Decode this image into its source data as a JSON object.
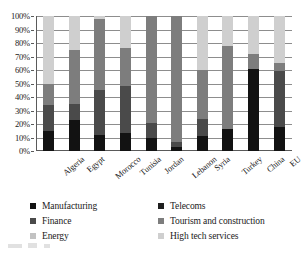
{
  "chart_data": {
    "type": "bar",
    "subtype": "stacked-100-percent",
    "title": "",
    "xlabel": "",
    "ylabel": "",
    "ylim": [
      0,
      100
    ],
    "yticks": [
      "0%",
      "10%",
      "20%",
      "30%",
      "40%",
      "50%",
      "60%",
      "70%",
      "80%",
      "90%",
      "100%"
    ],
    "grid": true,
    "legend_position": "bottom",
    "categories": [
      "Algeria",
      "Egypt",
      "Morocco",
      "Tunisia",
      "Jordan",
      "Lebanon",
      "Syria",
      "Turkey",
      "China",
      "EU"
    ],
    "series": [
      {
        "name": "Manufacturing",
        "color": "#121212",
        "values": [
          15,
          23,
          12,
          13,
          10,
          3,
          11,
          16,
          61,
          18
        ]
      },
      {
        "name": "Finance",
        "color": "#4a4a4a",
        "values": [
          19,
          12,
          33,
          35,
          11,
          4,
          13,
          0,
          0,
          41
        ]
      },
      {
        "name": "Energy",
        "color": "#c2c2c2",
        "values": [
          0,
          0,
          0,
          0,
          0,
          0,
          0,
          0,
          0,
          0
        ]
      },
      {
        "name": "Telecoms",
        "color": "#1f1f1f",
        "values": [
          0,
          0,
          0,
          0,
          0,
          0,
          0,
          0,
          0,
          0
        ]
      },
      {
        "name": "Tourism and construction",
        "color": "#7d7d7d",
        "values": [
          16,
          40,
          53,
          28,
          79,
          93,
          36,
          62,
          11,
          6
        ]
      },
      {
        "name": "High tech services",
        "color": "#cfcfcf",
        "values": [
          50,
          25,
          2,
          24,
          0,
          0,
          40,
          22,
          28,
          35
        ]
      }
    ],
    "stack_order": [
      "Manufacturing",
      "Finance",
      "Tourism and construction",
      "High tech services"
    ]
  },
  "legend": {
    "columns": [
      {
        "items": [
          {
            "label": "Manufacturing",
            "color": "#121212",
            "swatch": "square-swatch"
          },
          {
            "label": "Finance",
            "color": "#4a4a4a",
            "swatch": "square-swatch"
          },
          {
            "label": "Energy",
            "color": "#c2c2c2",
            "swatch": "square-swatch"
          }
        ]
      },
      {
        "items": [
          {
            "label": "Telecoms",
            "color": "#1f1f1f",
            "swatch": "square-swatch"
          },
          {
            "label": "Tourism and construction",
            "color": "#7d7d7d",
            "swatch": "square-swatch"
          },
          {
            "label": "High tech services",
            "color": "#cfcfcf",
            "swatch": "square-swatch"
          }
        ]
      }
    ]
  },
  "axis": {
    "y_tick_labels": [
      "100%",
      "90%",
      "80%",
      "70%",
      "60%",
      "50%",
      "40%",
      "30%",
      "20%",
      "10%",
      "0%"
    ]
  },
  "colors": {
    "axis_line": "#5a5a5a",
    "gridline": "#8d8d8d",
    "text": "#1a1a1a",
    "background": "#ffffff"
  }
}
